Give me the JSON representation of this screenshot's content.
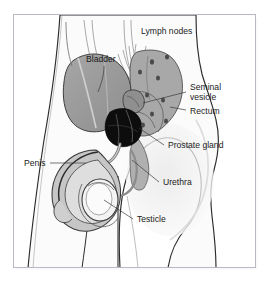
{
  "figure": {
    "title_visible": false,
    "kind": "medical-anatomy-diagram",
    "frame": {
      "border_color": "#b9b9c4",
      "background": "#ffffff"
    }
  },
  "palette": {
    "outline": "#2b2b2b",
    "body_fill": "#fbfbfb",
    "skin_shadow": "#efefef",
    "bladder_fill": "#9a9a9a",
    "pelvic_fill": "#a8a8a8",
    "rectum_fill": "#9e9e9e",
    "prostate_fill": "#0d0d0d",
    "penis_fill": "#c6c6c6",
    "testicle_fill": "#f3f3f3",
    "vessel_stroke": "#8d8d8d",
    "lymph_node_fill": "#4a4a4a",
    "label_text": "#1b1b1b",
    "leader_line": "#3a3a3a"
  },
  "labels": [
    {
      "id": "lymph-nodes",
      "text": "Lymph nodes",
      "x": 141,
      "y": 34,
      "anchor": "start",
      "lines": [
        "Lymph nodes"
      ]
    },
    {
      "id": "bladder",
      "text": "Bladder",
      "x": 86,
      "y": 62,
      "anchor": "start",
      "lines": [
        "Bladder"
      ]
    },
    {
      "id": "seminal-vesicle",
      "text": "Seminal vesicle",
      "x": 190,
      "y": 90,
      "anchor": "start",
      "lines": [
        "Seminal",
        "vesicle"
      ]
    },
    {
      "id": "rectum",
      "text": "Rectum",
      "x": 190,
      "y": 113,
      "anchor": "start",
      "lines": [
        "Rectum"
      ]
    },
    {
      "id": "prostate-gland",
      "text": "Prostate gland",
      "x": 168,
      "y": 148,
      "anchor": "start",
      "lines": [
        "Prostate gland"
      ]
    },
    {
      "id": "penis",
      "text": "Penis",
      "x": 24,
      "y": 166,
      "anchor": "start",
      "lines": [
        "Penis"
      ]
    },
    {
      "id": "urethra",
      "text": "Urethra",
      "x": 163,
      "y": 185,
      "anchor": "start",
      "lines": [
        "Urethra"
      ]
    },
    {
      "id": "testicle",
      "text": "Testicle",
      "x": 137,
      "y": 222,
      "anchor": "start",
      "lines": [
        "Testicle"
      ]
    }
  ],
  "structures": [
    {
      "id": "bladder",
      "name": "Bladder",
      "fill": "#9a9a9a"
    },
    {
      "id": "seminal-vesicle",
      "name": "Seminal vesicle",
      "fill": "#8f8f8f"
    },
    {
      "id": "rectum",
      "name": "Rectum",
      "fill": "#9e9e9e"
    },
    {
      "id": "prostate-gland",
      "name": "Prostate gland",
      "fill": "#0d0d0d"
    },
    {
      "id": "urethra",
      "name": "Urethra",
      "fill": "#b5b5b5"
    },
    {
      "id": "penis",
      "name": "Penis",
      "fill": "#c6c6c6"
    },
    {
      "id": "testicle",
      "name": "Testicle",
      "fill": "#f3f3f3"
    },
    {
      "id": "lymph-nodes",
      "name": "Lymph nodes",
      "fill": "#4a4a4a"
    }
  ],
  "lymph_nodes": [
    {
      "cx": 152,
      "cy": 62
    },
    {
      "cx": 164,
      "cy": 57
    },
    {
      "cx": 141,
      "cy": 72
    },
    {
      "cx": 157,
      "cy": 78
    },
    {
      "cx": 149,
      "cy": 95
    },
    {
      "cx": 162,
      "cy": 100
    },
    {
      "cx": 153,
      "cy": 113
    },
    {
      "cx": 166,
      "cy": 120
    },
    {
      "cx": 144,
      "cy": 124
    }
  ]
}
